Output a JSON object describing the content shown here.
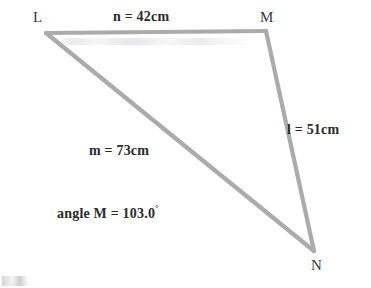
{
  "figure": {
    "type": "triangle-diagram",
    "background_color": "#ffffff",
    "stroke_color": "#a8a8a8",
    "text_color": "#2b2b2b",
    "vertices": [
      {
        "name": "L",
        "label": "L",
        "x": 46,
        "y": 33,
        "label_x": 33,
        "label_y": 10
      },
      {
        "name": "M",
        "label": "M",
        "x": 265,
        "y": 32,
        "label_x": 260,
        "label_y": 10
      },
      {
        "name": "N",
        "label": "N",
        "x": 313,
        "y": 252,
        "label_x": 311,
        "label_y": 258
      }
    ],
    "sides": [
      {
        "name": "n",
        "label": "n = 42cm",
        "from": "L",
        "to": "M",
        "length": 42,
        "unit": "cm",
        "label_x": 113,
        "label_y": 10
      },
      {
        "name": "l",
        "label": "l = 51cm",
        "from": "M",
        "to": "N",
        "length": 51,
        "unit": "cm",
        "label_x": 287,
        "label_y": 123
      },
      {
        "name": "m",
        "label": "m = 73cm",
        "from": "L",
        "to": "N",
        "length": 73,
        "unit": "cm",
        "label_x": 89,
        "label_y": 144
      }
    ],
    "angle": {
      "vertex": "M",
      "prefix": "angle M = ",
      "value": "103.0",
      "degree_symbol": "°",
      "full_label": "angle M = 103.0°",
      "label_x": 57,
      "label_y": 205
    }
  }
}
